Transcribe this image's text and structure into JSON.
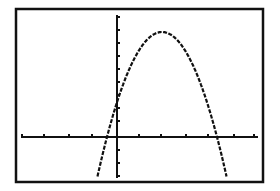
{
  "screen": {
    "background": "#ffffff",
    "ink": "#111111",
    "frame": {
      "left": 16,
      "top": 9,
      "right": 263,
      "bottom": 182,
      "stroke": 2.5
    }
  },
  "chart_data": {
    "type": "line",
    "title": "",
    "xlabel": "",
    "ylabel": "",
    "grid": false,
    "legend": null,
    "axes": {
      "x_axis_pixel_y": 137,
      "y_axis_pixel_x": 117,
      "x_tick_pixels": [
        22,
        44,
        69,
        92,
        139,
        161,
        186,
        208,
        234,
        254
      ],
      "y_tick_pixels": [
        17,
        30,
        43,
        56,
        69,
        82,
        95,
        108,
        121,
        150,
        163,
        176
      ],
      "y_axis_top": 15,
      "y_axis_bottom": 178,
      "x_axis_left": 21,
      "x_axis_right": 258,
      "x_ticks_left_of_origin": 4,
      "x_ticks_right_of_origin": 6
    },
    "curve": {
      "form": "parabola",
      "vertex_pixel": [
        162,
        32
      ],
      "a_pixel": 0.0347,
      "x_start_pixel": 97,
      "x_end_pixel": 227,
      "x_intercepts_pixel": [
        107,
        217
      ],
      "y_intercept_pixel": 112,
      "clip_bottom": 178
    }
  }
}
